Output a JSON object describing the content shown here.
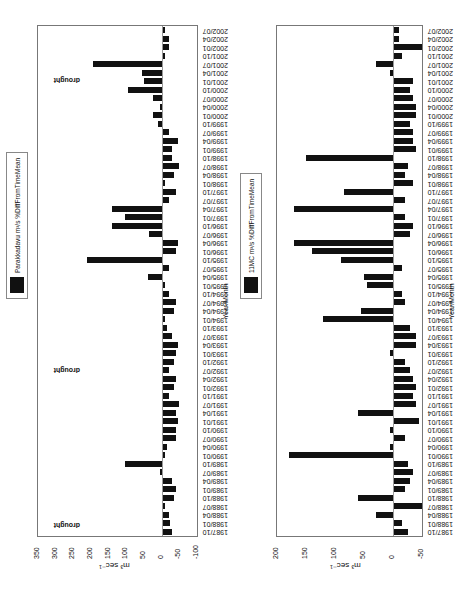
{
  "figure": {
    "caption": "",
    "charts": [
      {
        "id": "chart-top",
        "legend": "Parakkadavu m³/s %DiffFromTimeMean",
        "ylabel": "m³ sec⁻¹",
        "xlabel": "Year/Month",
        "annotations": [
          "drought",
          "drought",
          "drought"
        ]
      },
      {
        "id": "chart-bottom",
        "legend": "11MC m³/s %DiffFromTimeMean",
        "ylabel": "m³ sec⁻¹",
        "xlabel": "Year/Month",
        "annotations": []
      }
    ]
  },
  "chart_data": [
    {
      "type": "bar",
      "title": "",
      "legend": [
        "Parakkadavu m³/s %DiffFromTimeMean"
      ],
      "xlabel": "Year/Month",
      "ylabel": "m³ sec⁻¹",
      "ylim": [
        -100,
        350
      ],
      "yticks": [
        -100,
        -50,
        0,
        50,
        100,
        150,
        200,
        250,
        300,
        350
      ],
      "xtick_labels": [
        "1987/10",
        "1988/01",
        "1988/04",
        "1988/07",
        "1988/10",
        "1989/01",
        "1989/04",
        "1989/07",
        "1989/10",
        "1990/01",
        "1990/04",
        "1990/07",
        "1990/10",
        "1991/01",
        "1991/04",
        "1991/07",
        "1991/10",
        "1992/01",
        "1992/04",
        "1992/07",
        "1992/10",
        "1993/01",
        "1993/04",
        "1993/07",
        "1993/10",
        "1994/01",
        "1994/04",
        "1994/07",
        "1994/10",
        "1995/01",
        "1995/04",
        "1995/07",
        "1995/10",
        "1996/01",
        "1996/04",
        "1996/07",
        "1996/10",
        "1997/01",
        "1997/04",
        "1997/07",
        "1997/10",
        "1998/01",
        "1998/04",
        "1998/07",
        "1998/10",
        "1999/01",
        "1999/04",
        "1999/07",
        "1999/10",
        "2000/01",
        "2000/04",
        "2000/07",
        "2000/10",
        "2001/01",
        "2001/04",
        "2001/07",
        "2001/10",
        "2002/01",
        "2002/04",
        "2002/07"
      ],
      "annotations": [
        {
          "text": "drought",
          "x": "1988/04"
        },
        {
          "text": "drought",
          "x": "1993/04"
        },
        {
          "text": "drought",
          "x": "2000/07"
        }
      ],
      "values": [
        -30,
        -25,
        -20,
        -10,
        -35,
        -40,
        -30,
        5,
        105,
        -10,
        -15,
        -40,
        -40,
        -45,
        -40,
        -50,
        -20,
        -35,
        -40,
        -20,
        -35,
        -40,
        -45,
        -30,
        -15,
        -10,
        -35,
        -40,
        -20,
        -10,
        40,
        -20,
        210,
        -40,
        -45,
        35,
        140,
        105,
        140,
        -20,
        -40,
        -10,
        -35,
        -50,
        -30,
        -30,
        -45,
        -20,
        10,
        25,
        5,
        25,
        95,
        50,
        55,
        195,
        -10,
        -20,
        -20,
        -10
      ],
      "monthly_values_note": "bar heights sampled per labeled quarter; actual series is monthly"
    },
    {
      "type": "bar",
      "title": "",
      "legend": [
        "11MC m³/s %DiffFromTimeMean"
      ],
      "xlabel": "Year/Month",
      "ylabel": "m³ sec⁻¹",
      "ylim": [
        -50,
        200
      ],
      "yticks": [
        -50,
        0,
        50,
        100,
        150,
        200
      ],
      "xtick_labels": [
        "1987/10",
        "1988/01",
        "1988/04",
        "1988/07",
        "1988/10",
        "1989/01",
        "1989/04",
        "1989/07",
        "1989/10",
        "1990/01",
        "1990/04",
        "1990/07",
        "1990/10",
        "1991/01",
        "1991/04",
        "1991/07",
        "1991/10",
        "1992/01",
        "1992/04",
        "1992/07",
        "1992/10",
        "1993/01",
        "1993/04",
        "1993/07",
        "1993/10",
        "1994/01",
        "1994/04",
        "1994/07",
        "1994/10",
        "1995/01",
        "1995/04",
        "1995/07",
        "1995/10",
        "1996/01",
        "1996/04",
        "1996/07",
        "1996/10",
        "1997/01",
        "1997/04",
        "1997/07",
        "1997/10",
        "1998/01",
        "1998/04",
        "1998/07",
        "1998/10",
        "1999/01",
        "1999/04",
        "1999/07",
        "1999/10",
        "2000/01",
        "2000/04",
        "2000/07",
        "2000/10",
        "2001/01",
        "2001/04",
        "2001/07",
        "2001/10",
        "2002/01",
        "2002/04",
        "2002/07"
      ],
      "values": [
        -25,
        -15,
        30,
        -50,
        60,
        -20,
        -30,
        -35,
        -25,
        180,
        5,
        -20,
        5,
        -45,
        60,
        -40,
        -35,
        -40,
        -35,
        -30,
        -20,
        5,
        -40,
        -40,
        -30,
        120,
        55,
        -20,
        -15,
        45,
        50,
        -15,
        90,
        140,
        170,
        -30,
        -35,
        -20,
        170,
        -20,
        85,
        -35,
        -20,
        -25,
        150,
        -40,
        -35,
        -35,
        -30,
        -40,
        -40,
        -35,
        -30,
        -35,
        5,
        30,
        -15,
        -50,
        -10,
        -10
      ]
    }
  ]
}
